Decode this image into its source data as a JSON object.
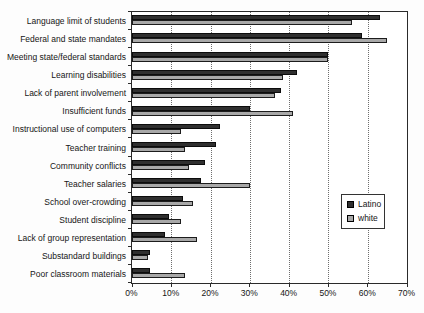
{
  "chart_data": {
    "type": "bar",
    "orientation": "horizontal",
    "title": "",
    "xlabel": "",
    "ylabel": "",
    "xlim": [
      0,
      70
    ],
    "x_ticks": [
      "0%",
      "10%",
      "20%",
      "30%",
      "40%",
      "50%",
      "60%",
      "70%"
    ],
    "grid": "vertical-dotted",
    "legend_position": "middle-right",
    "categories": [
      "Language limit of students",
      "Federal and state mandates",
      "Meeting state/federal standards",
      "Learning disabilities",
      "Lack of parent involvement",
      "Insufficient funds",
      "Instructional use of computers",
      "Teacher training",
      "Community conflicts",
      "Teacher salaries",
      "School over-crowding",
      "Student discipline",
      "Lack of group representation",
      "Substandard buildings",
      "Poor classroom materials"
    ],
    "series": [
      {
        "name": "Latino",
        "color": "#2f2f2f",
        "values": [
          63,
          58.5,
          50,
          42,
          38,
          30,
          22.5,
          21.5,
          18.5,
          17.5,
          13,
          9.5,
          8.5,
          4.5,
          4.5
        ]
      },
      {
        "name": "white",
        "color": "#a8a8a8",
        "values": [
          56,
          65,
          50,
          38.5,
          36.5,
          41,
          12.5,
          13.5,
          14.5,
          30,
          15.5,
          12.5,
          16.5,
          4,
          13.5
        ]
      }
    ]
  }
}
